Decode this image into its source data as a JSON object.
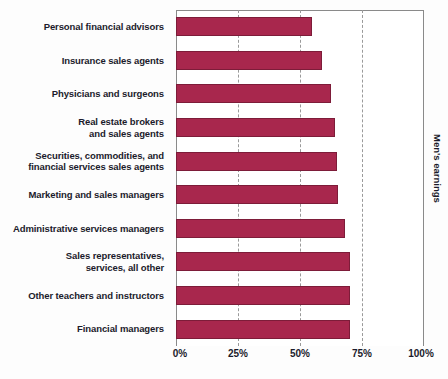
{
  "chart_data": {
    "type": "bar",
    "orientation": "horizontal",
    "title": "",
    "subtitle": "",
    "xlabel": "",
    "ylabel": "",
    "right_axis_label": "Men's earnings",
    "xlim": [
      0,
      100
    ],
    "xticks": [
      "0%",
      "25%",
      "50%",
      "75%",
      "100%"
    ],
    "xtick_values": [
      0,
      25,
      50,
      75,
      100
    ],
    "grid": true,
    "grid_axis": "x",
    "legend": null,
    "bar_color": "#a8274d",
    "bar_border_color": "#7d1c39",
    "categories": [
      "Personal financial advisors",
      "Insurance sales agents",
      "Physicians and surgeons",
      "Real estate brokers\nand sales agents",
      "Securities, commodities, and\nfinancial services sales agents",
      "Marketing and sales managers",
      "Administrative services managers",
      "Sales representatives,\nservices, all other",
      "Other teachers and instructors",
      "Financial managers"
    ],
    "values": [
      55,
      59,
      62.5,
      64,
      65,
      65.5,
      68,
      70,
      70,
      70
    ]
  },
  "categories_display": [
    {
      "line1": "Personal financial advisors",
      "line2": ""
    },
    {
      "line1": "Insurance sales agents",
      "line2": ""
    },
    {
      "line1": "Physicians and surgeons",
      "line2": ""
    },
    {
      "line1": "Real estate brokers",
      "line2": "and sales agents"
    },
    {
      "line1": "Securities, commodities, and",
      "line2": "financial services sales agents"
    },
    {
      "line1": "Marketing and sales managers",
      "line2": ""
    },
    {
      "line1": "Administrative services managers",
      "line2": ""
    },
    {
      "line1": "Sales representatives,",
      "line2": "services, all other"
    },
    {
      "line1": "Other teachers and instructors",
      "line2": ""
    },
    {
      "line1": "Financial managers",
      "line2": ""
    }
  ]
}
